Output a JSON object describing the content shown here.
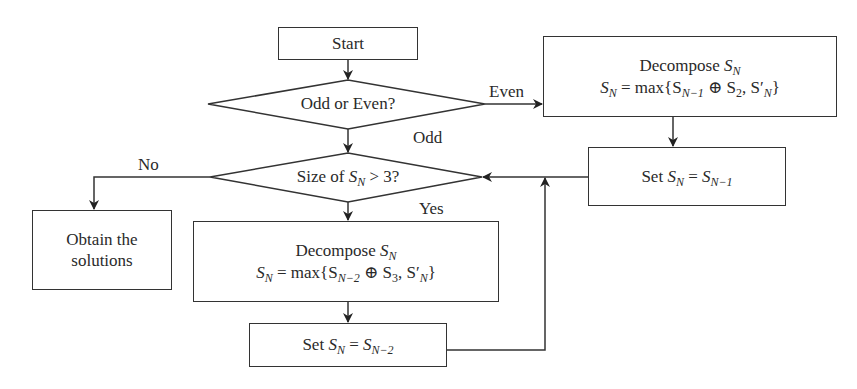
{
  "diagram": {
    "type": "flowchart",
    "nodes": {
      "start": {
        "label": "Start"
      },
      "odd_even": {
        "label": "Odd or Even?"
      },
      "decompose_even": {
        "title": "Decompose",
        "formula_lhs": "S",
        "formula_lhs_sub": "N",
        "formula_text": "max{S",
        "formula_text_sub": "N−1",
        "op": " ⊕ S",
        "op_sub": "2",
        "tail": ", S′",
        "tail_sub": "N",
        "close": "}",
        "title_var": "S",
        "title_var_sub": "N"
      },
      "set_even": {
        "prefix": "Set ",
        "var": "S",
        "var_sub": "N",
        "eq": " = ",
        "rhs": "S",
        "rhs_sub": "N−1"
      },
      "size_check": {
        "prefix": "Size of ",
        "var": "S",
        "var_sub": "N",
        "suffix": " > 3?"
      },
      "obtain": {
        "line1": "Obtain the",
        "line2": "solutions"
      },
      "decompose_odd": {
        "title": "Decompose",
        "formula_lhs": "S",
        "formula_lhs_sub": "N",
        "formula_text": "max{S",
        "formula_text_sub": "N−2",
        "op": " ⊕ S",
        "op_sub": "3",
        "tail": ", S′",
        "tail_sub": "N",
        "close": "}",
        "title_var": "S",
        "title_var_sub": "N"
      },
      "set_odd": {
        "prefix": "Set ",
        "var": "S",
        "var_sub": "N",
        "eq": " = ",
        "rhs": "S",
        "rhs_sub": "N−2"
      }
    },
    "edge_labels": {
      "even": "Even",
      "odd": "Odd",
      "no": "No",
      "yes": "Yes"
    },
    "edges": [
      {
        "from": "start",
        "to": "odd_even"
      },
      {
        "from": "odd_even",
        "to": "decompose_even",
        "label": "Even"
      },
      {
        "from": "odd_even",
        "to": "size_check",
        "label": "Odd"
      },
      {
        "from": "decompose_even",
        "to": "set_even"
      },
      {
        "from": "set_even",
        "to": "size_check"
      },
      {
        "from": "size_check",
        "to": "obtain",
        "label": "No"
      },
      {
        "from": "size_check",
        "to": "decompose_odd",
        "label": "Yes"
      },
      {
        "from": "decompose_odd",
        "to": "set_odd"
      },
      {
        "from": "set_odd",
        "to": "size_check"
      }
    ],
    "colors": {
      "line": "#333333",
      "text": "#2a2a2a",
      "background": "#ffffff"
    }
  }
}
